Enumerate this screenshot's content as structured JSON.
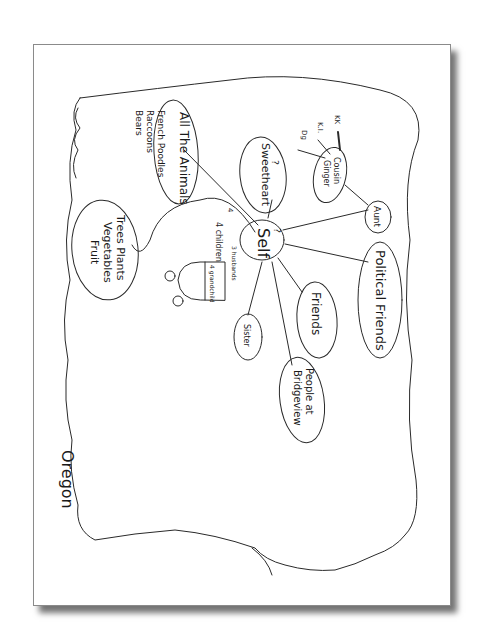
{
  "diagram": {
    "type": "hand-drawn mind map (rotated 90°)",
    "region_label": "Oregon",
    "center": {
      "label": "Self",
      "annotation": "?"
    },
    "center_notes": {
      "husbands": "3 husbands",
      "children": "4 children",
      "grandchild": "4 grandchild",
      "mark": "4"
    },
    "nodes": [
      {
        "id": "animals",
        "label": "All The Animals",
        "notes": [
          "French Poodles",
          "Raccoons",
          "Bears"
        ]
      },
      {
        "id": "plants",
        "label_lines": [
          "Trees Plants",
          "Vegetables",
          "Fruit"
        ]
      },
      {
        "id": "sweetheart",
        "label": "Sweetheart",
        "mark": "?"
      },
      {
        "id": "cousin",
        "label_lines": [
          "Cousin",
          "Ginger"
        ],
        "children": [
          "KK",
          "K.I.",
          "Dg"
        ]
      },
      {
        "id": "aunt",
        "label": "Aunt"
      },
      {
        "id": "political",
        "label": "Political Friends"
      },
      {
        "id": "friends",
        "label": "Friends"
      },
      {
        "id": "sister",
        "label": "Sister"
      },
      {
        "id": "bridgeview",
        "label_lines": [
          "People at",
          "Bridgeview"
        ]
      }
    ]
  }
}
